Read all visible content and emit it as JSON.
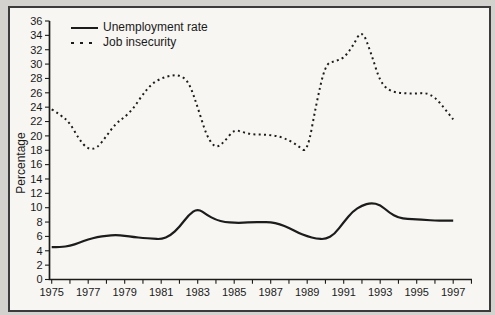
{
  "colors": {
    "line": "#1c1c1c",
    "plot_background": "#f7f6f2",
    "page_background": "#d4d2ce",
    "frame_border": "#3b3b3b",
    "text": "#1a1a1a"
  },
  "chart_data": {
    "type": "line",
    "title": "",
    "xlabel": "",
    "ylabel": "Percentage",
    "ylim": [
      0,
      36
    ],
    "yticks": [
      0,
      2,
      4,
      6,
      8,
      10,
      12,
      14,
      16,
      18,
      20,
      22,
      24,
      26,
      28,
      30,
      32,
      34,
      36
    ],
    "xlim": [
      1975,
      1998
    ],
    "xticks_minor_step": 1,
    "xticks_labeled": [
      1975,
      1977,
      1979,
      1981,
      1983,
      1985,
      1987,
      1989,
      1991,
      1993,
      1995,
      1997
    ],
    "grid": false,
    "legend_position": "top-left-inside",
    "x": [
      1975,
      1975.5,
      1976,
      1976.5,
      1977,
      1977.5,
      1978,
      1978.5,
      1979,
      1979.5,
      1980,
      1980.5,
      1981,
      1981.5,
      1982,
      1982.5,
      1983,
      1983.5,
      1984,
      1984.5,
      1985,
      1985.5,
      1986,
      1986.5,
      1987,
      1987.5,
      1988,
      1988.5,
      1989,
      1989.5,
      1990,
      1990.5,
      1991,
      1991.5,
      1992,
      1992.5,
      1993,
      1993.5,
      1994,
      1994.5,
      1995,
      1995.5,
      1996,
      1996.5,
      1997
    ],
    "series": [
      {
        "name": "Unemployment rate",
        "style": "solid",
        "color": "#1c1c1c",
        "values": [
          4.5,
          4.5,
          4.7,
          5.1,
          5.6,
          5.9,
          6.1,
          6.2,
          6.1,
          5.9,
          5.8,
          5.7,
          5.6,
          6.1,
          7.3,
          9.0,
          9.9,
          9.0,
          8.3,
          8.0,
          7.9,
          7.9,
          8.0,
          8.0,
          8.0,
          7.7,
          7.2,
          6.5,
          6.0,
          5.7,
          5.6,
          6.3,
          8.0,
          9.5,
          10.3,
          10.7,
          10.4,
          9.3,
          8.6,
          8.4,
          8.4,
          8.3,
          8.2,
          8.2,
          8.2
        ]
      },
      {
        "name": "Job insecurity",
        "style": "dotted",
        "color": "#1c1c1c",
        "values": [
          23.7,
          22.9,
          21.8,
          19.5,
          18.1,
          18.3,
          20.0,
          21.7,
          22.6,
          23.9,
          25.8,
          27.3,
          28.0,
          28.4,
          28.5,
          27.6,
          24.0,
          19.9,
          18.2,
          19.3,
          20.9,
          20.5,
          20.2,
          20.2,
          20.1,
          19.9,
          19.4,
          18.6,
          17.6,
          24.5,
          30.0,
          30.4,
          30.8,
          32.5,
          34.9,
          31.5,
          27.5,
          26.3,
          26.0,
          25.9,
          25.9,
          26.0,
          25.4,
          23.9,
          22.3
        ]
      }
    ]
  }
}
